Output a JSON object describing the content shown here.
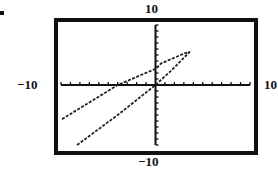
{
  "figure": {
    "bullet": "•"
  },
  "chart_data": {
    "type": "line",
    "title": "",
    "xlabel": "",
    "ylabel": "",
    "xlim": [
      -10,
      10
    ],
    "ylim": [
      -10,
      10
    ],
    "grid": false,
    "axis_labels": {
      "xmin": "−10",
      "xmax": "10",
      "ymin": "−10",
      "ymax": "10"
    },
    "tick_spacing": 1,
    "series": [
      {
        "name": "curve",
        "x": [
          -8.3,
          -4.0,
          0.0,
          1.8,
          3.6,
          3.1,
          0.6,
          0.0,
          -4.0,
          -10.0
        ],
        "y": [
          -10.0,
          -5.0,
          0.0,
          2.6,
          5.5,
          5.3,
          3.6,
          2.7,
          0.0,
          -5.8
        ]
      }
    ]
  }
}
